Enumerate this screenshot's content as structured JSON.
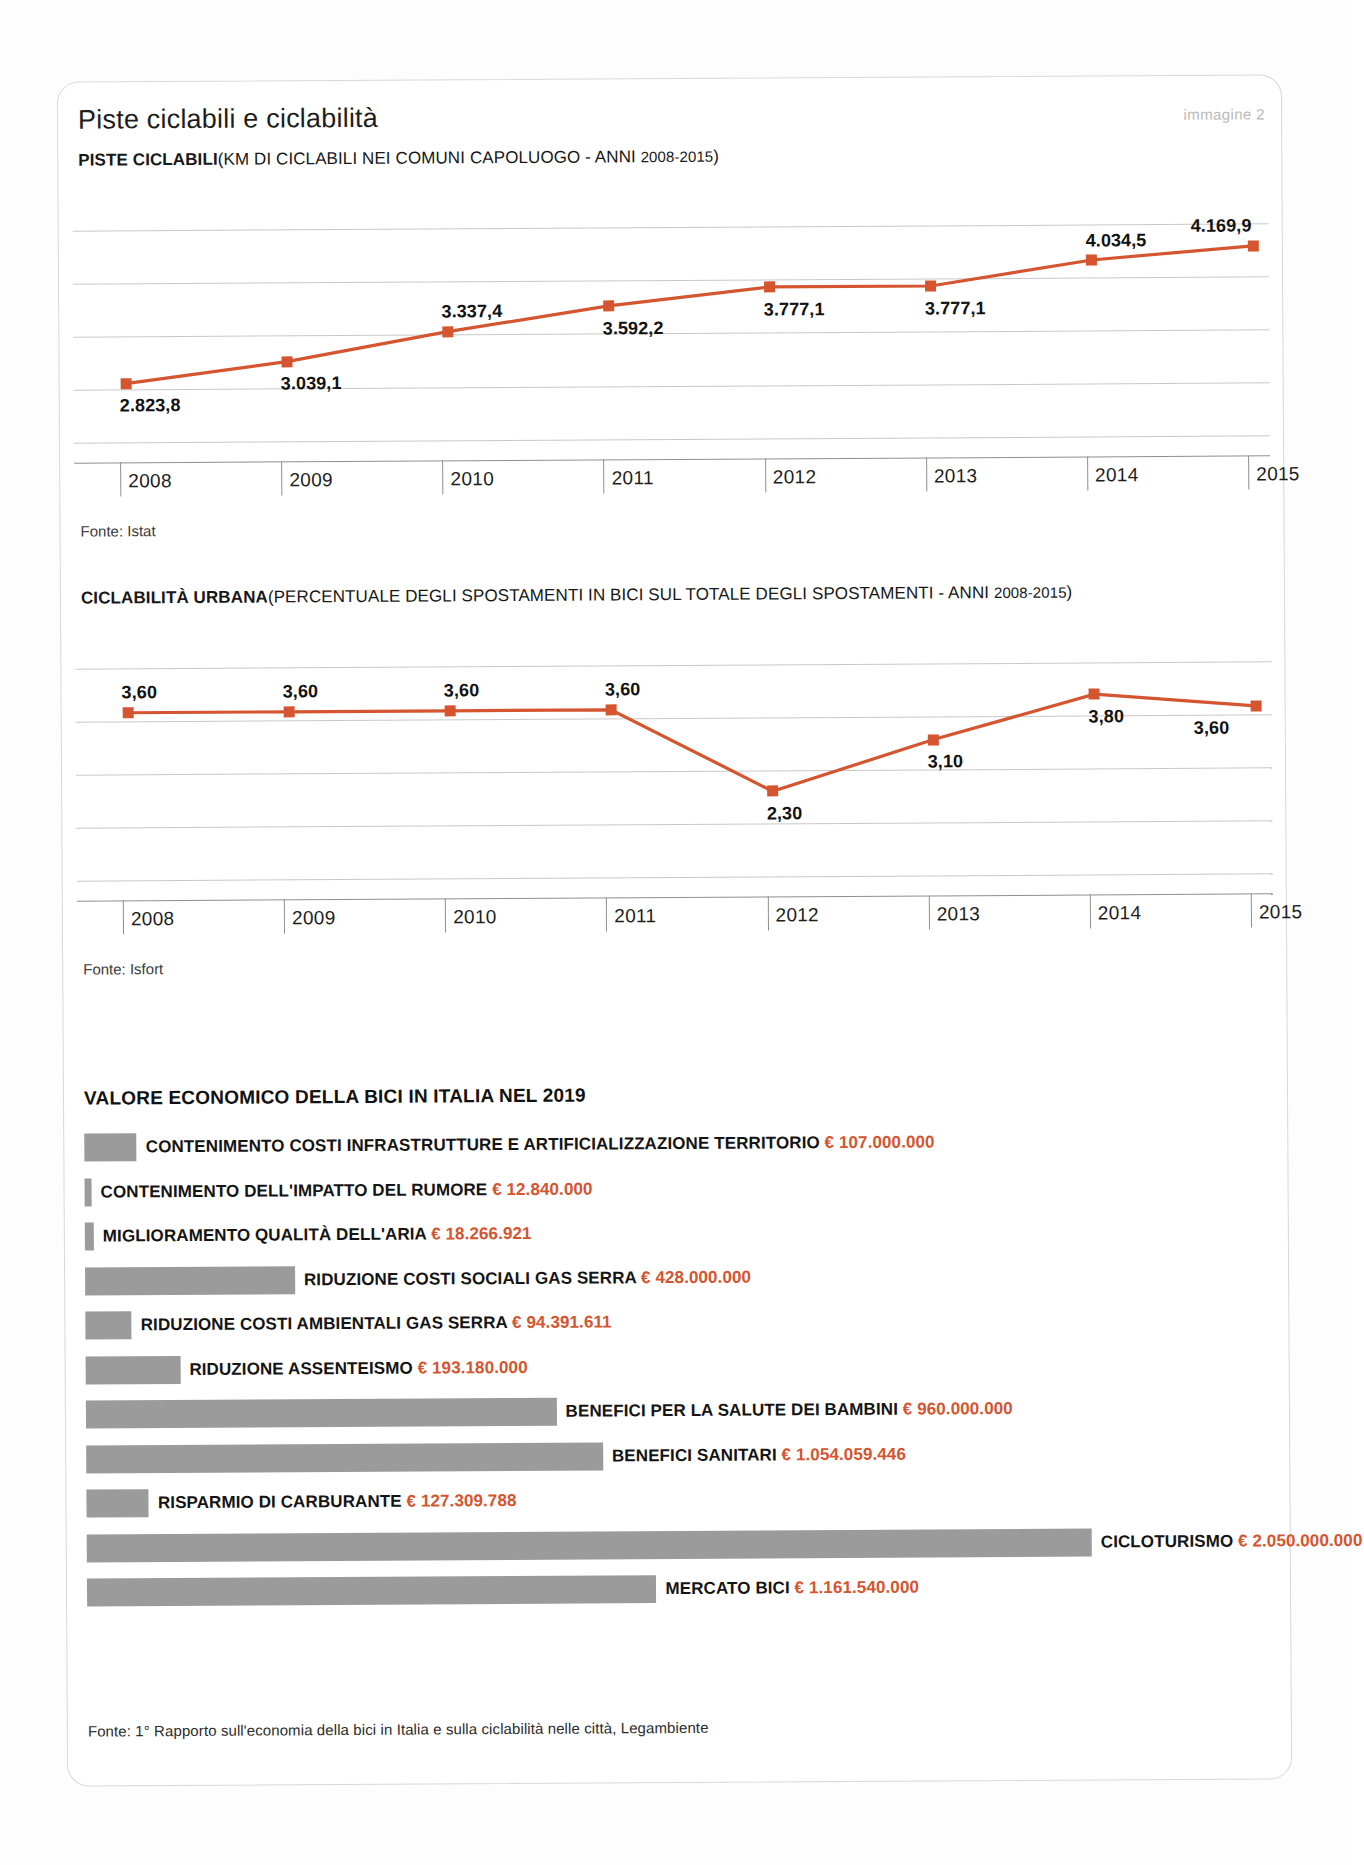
{
  "header": {
    "title": "Piste ciclabili e ciclabilità",
    "image_tag": "immagine 2"
  },
  "section1": {
    "label": "PISTE CICLABILI",
    "paren_open": "(KM DI CICLABILI NEI COMUNI CAPOLUOGO - ANNI ",
    "years": "2008-2015",
    "paren_close": ")",
    "fonte": "Fonte: Istat"
  },
  "section2": {
    "label": "CICLABILITÀ URBANA",
    "paren_open": "(PERCENTUALE DEGLI SPOSTAMENTI IN BICI SUL TOTALE DEGLI SPOSTAMENTI - ANNI ",
    "years": "2008-2015",
    "paren_close": ")",
    "fonte": "Fonte: Isfort"
  },
  "bars_section": {
    "title": "VALORE ECONOMICO DELLA BICI IN ITALIA NEL 2019",
    "fonte": "Fonte: 1° Rapporto sull'economia della bici in Italia e sulla ciclabilità nelle città, Legambiente",
    "currency": "€"
  },
  "colors": {
    "line": "#d4552f",
    "bar": "#9b9b9b",
    "value_text": "#d4552f",
    "grid": "#c9c9c9"
  },
  "chart_data": [
    {
      "type": "line",
      "title": "PISTE CICLABILI (KM DI CICLABILI NEI COMUNI CAPOLUOGO - ANNI 2008-2015)",
      "xlabel": "",
      "ylabel": "",
      "grid": true,
      "legend": "none",
      "categories": [
        "2008",
        "2009",
        "2010",
        "2011",
        "2012",
        "2013",
        "2014",
        "2015"
      ],
      "values": [
        2823.8,
        3039.1,
        3337.4,
        3592.2,
        3777.1,
        3777.1,
        4034.5,
        4169.9
      ],
      "value_labels": [
        "2.823,8",
        "3.039,1",
        "3.337,4",
        "3.592,2",
        "3.777,1",
        "3.777,1",
        "4.034,5",
        "4.169,9"
      ],
      "label_positions": [
        "below",
        "below",
        "above",
        "below",
        "below",
        "below",
        "above",
        "above"
      ],
      "ylim": [
        2600,
        4400
      ],
      "source": "Fonte: Istat"
    },
    {
      "type": "line",
      "title": "CICLABILITÀ URBANA (PERCENTUALE DEGLI SPOSTAMENTI IN BICI SUL TOTALE DEGLI SPOSTAMENTI - ANNI 2008-2015)",
      "xlabel": "",
      "ylabel": "",
      "grid": true,
      "legend": "none",
      "categories": [
        "2008",
        "2009",
        "2010",
        "2011",
        "2012",
        "2013",
        "2014",
        "2015"
      ],
      "values": [
        3.6,
        3.6,
        3.6,
        3.6,
        2.3,
        3.1,
        3.8,
        3.6
      ],
      "value_labels": [
        "3,60",
        "3,60",
        "3,60",
        "3,60",
        "2,30",
        "3,10",
        "3,80",
        "3,60"
      ],
      "label_positions": [
        "above",
        "above",
        "above",
        "above",
        "below",
        "below",
        "below",
        "below"
      ],
      "ylim": [
        1.7,
        4.3
      ],
      "source": "Fonte: Isfort"
    },
    {
      "type": "bar",
      "orientation": "horizontal",
      "title": "VALORE ECONOMICO DELLA BICI IN ITALIA NEL 2019",
      "xlabel": "",
      "ylabel": "",
      "grid": false,
      "legend": "none",
      "categories": [
        "CONTENIMENTO COSTI INFRASTRUTTURE E ARTIFICIALIZZAZIONE TERRITORIO",
        "CONTENIMENTO DELL'IMPATTO DEL RUMORE",
        "MIGLIORAMENTO QUALITÀ DELL'ARIA",
        "RIDUZIONE COSTI SOCIALI GAS SERRA",
        "RIDUZIONE COSTI AMBIENTALI GAS SERRA",
        "RIDUZIONE ASSENTEISMO",
        "BENEFICI PER LA SALUTE DEI BAMBINI",
        "BENEFICI SANITARI",
        "RISPARMIO DI CARBURANTE",
        "CICLOTURISMO",
        "MERCATO BICI"
      ],
      "values": [
        107000000,
        12840000,
        18266921,
        428000000,
        94391611,
        193180000,
        960000000,
        1054059446,
        127309788,
        2050000000,
        1161540000
      ],
      "value_labels": [
        "107.000.000",
        "12.840.000",
        "18.266.921",
        "428.000.000",
        "94.391.611",
        "193.180.000",
        "960.000.000",
        "1.054.059.446",
        "127.309.788",
        "2.050.000.000",
        "1.161.540.000"
      ],
      "source": "Fonte: 1° Rapporto sull'economia della bici in Italia e sulla ciclabilità nelle città, Legambiente"
    }
  ]
}
